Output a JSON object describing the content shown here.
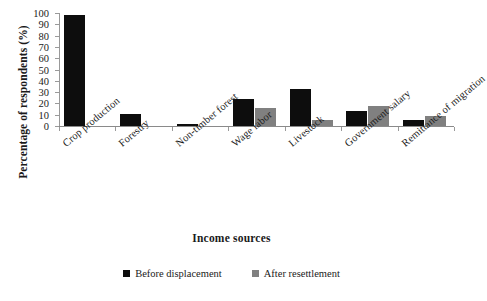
{
  "chart_data": {
    "type": "bar",
    "title": "",
    "xlabel": "Income sources",
    "ylabel": "Percentage of respondents (%)",
    "ylim": [
      0,
      100
    ],
    "yticks": [
      0,
      10,
      20,
      30,
      40,
      50,
      60,
      70,
      80,
      90,
      100
    ],
    "grid": false,
    "legend_position": "bottom",
    "categories": [
      "Crop production",
      "Forestry",
      "Non-timber forest",
      "Wage labor",
      "Livestock",
      "Government salary",
      "Remittance of migration"
    ],
    "series": [
      {
        "name": "Before displacement",
        "color": "#0d0d0d",
        "values": [
          98,
          11,
          2,
          24,
          33,
          13,
          5
        ]
      },
      {
        "name": "After resettlement",
        "color": "#808080",
        "values": [
          0,
          0,
          0,
          16,
          5,
          18,
          9
        ]
      }
    ]
  }
}
